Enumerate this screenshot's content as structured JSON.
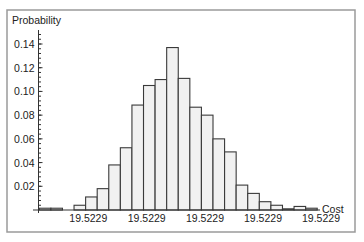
{
  "chart_data": {
    "type": "bar",
    "title": "",
    "xlabel": "Cost",
    "ylabel": "Probability",
    "ylim": [
      0,
      0.15
    ],
    "grid": false,
    "legend": null,
    "y_ticks": [
      "0.02",
      "0.04",
      "0.06",
      "0.08",
      "0.10",
      "0.12",
      "0.14"
    ],
    "y_tick_values": [
      0.02,
      0.04,
      0.06,
      0.08,
      0.1,
      0.12,
      0.14
    ],
    "x_tick_labels": [
      "19.5229",
      "19.5229",
      "19.5229",
      "19.5229",
      "19.5229"
    ],
    "bin_count": 24,
    "values": [
      0.0015,
      0.0015,
      0.0,
      0.004,
      0.011,
      0.018,
      0.038,
      0.0525,
      0.0885,
      0.105,
      0.11,
      0.137,
      0.111,
      0.0867,
      0.08,
      0.06,
      0.049,
      0.021,
      0.014,
      0.007,
      0.004,
      0.001,
      0.003,
      0.0015
    ]
  }
}
